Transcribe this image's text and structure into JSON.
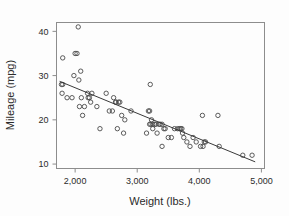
{
  "chart_data": {
    "type": "scatter",
    "title": "",
    "xlabel": "Weight (lbs.)",
    "ylabel": "Mileage (mpg)",
    "xlim": [
      1700,
      5050
    ],
    "ylim": [
      9,
      42
    ],
    "grid": false,
    "legend": null,
    "xticks": [
      2000,
      3000,
      4000,
      5000
    ],
    "xtick_labels": [
      "2,000",
      "3,000",
      "4,000",
      "5,000"
    ],
    "yticks": [
      10,
      20,
      30,
      40
    ],
    "ytick_labels": [
      "10",
      "20",
      "30",
      "40"
    ],
    "marker_style": "open-circle",
    "marker_color": "#4a4a4a",
    "line_color": "#3a3a3a",
    "frame_color": "#8d8d8d",
    "background_color": "#fdfdfd",
    "trendline": {
      "type": "linear-fit",
      "x_start": 1750,
      "y_start": 28.7,
      "x_end": 4900,
      "y_end": 10.5
    },
    "points": [
      [
        1800,
        34
      ],
      [
        1780,
        28
      ],
      [
        1800,
        28
      ],
      [
        1790,
        26
      ],
      [
        1870,
        25
      ],
      [
        1950,
        25
      ],
      [
        1980,
        30
      ],
      [
        2000,
        35
      ],
      [
        2030,
        35
      ],
      [
        2050,
        41
      ],
      [
        2060,
        29
      ],
      [
        2070,
        23
      ],
      [
        2090,
        31
      ],
      [
        2100,
        25
      ],
      [
        2120,
        21
      ],
      [
        2150,
        23
      ],
      [
        2200,
        26
      ],
      [
        2210,
        25
      ],
      [
        2230,
        25
      ],
      [
        2250,
        24
      ],
      [
        2270,
        26
      ],
      [
        2350,
        23
      ],
      [
        2400,
        18
      ],
      [
        2500,
        26
      ],
      [
        2550,
        22
      ],
      [
        2600,
        22
      ],
      [
        2620,
        25
      ],
      [
        2650,
        24
      ],
      [
        2660,
        24
      ],
      [
        2680,
        18
      ],
      [
        2700,
        24
      ],
      [
        2720,
        24
      ],
      [
        2750,
        21
      ],
      [
        2780,
        17
      ],
      [
        2800,
        20
      ],
      [
        2900,
        22
      ],
      [
        3150,
        17
      ],
      [
        3180,
        22
      ],
      [
        3200,
        22
      ],
      [
        3200,
        19
      ],
      [
        3210,
        28
      ],
      [
        3220,
        19
      ],
      [
        3230,
        20
      ],
      [
        3250,
        19
      ],
      [
        3250,
        18
      ],
      [
        3280,
        19
      ],
      [
        3300,
        19
      ],
      [
        3320,
        17
      ],
      [
        3350,
        19
      ],
      [
        3370,
        19
      ],
      [
        3400,
        19
      ],
      [
        3400,
        14
      ],
      [
        3430,
        18
      ],
      [
        3450,
        18
      ],
      [
        3500,
        16
      ],
      [
        3550,
        16
      ],
      [
        3600,
        18
      ],
      [
        3650,
        18
      ],
      [
        3680,
        18
      ],
      [
        3700,
        18
      ],
      [
        3720,
        18
      ],
      [
        3730,
        17
      ],
      [
        3750,
        16
      ],
      [
        3800,
        15
      ],
      [
        3850,
        14
      ],
      [
        3900,
        16
      ],
      [
        3950,
        15
      ],
      [
        4020,
        14
      ],
      [
        4050,
        21
      ],
      [
        4060,
        14
      ],
      [
        4080,
        15
      ],
      [
        4100,
        15
      ],
      [
        4300,
        21
      ],
      [
        4320,
        14
      ],
      [
        4700,
        12
      ],
      [
        4850,
        12
      ]
    ]
  }
}
